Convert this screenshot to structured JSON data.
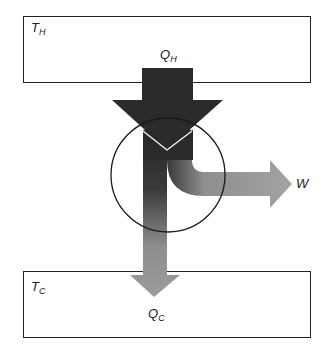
{
  "diagram": {
    "type": "heat-engine-energy-flow",
    "hot_reservoir": {
      "label": "T",
      "subscript": "H"
    },
    "cold_reservoir": {
      "label": "T",
      "subscript": "C"
    },
    "heat_in": {
      "label": "Q",
      "subscript": "H"
    },
    "heat_out": {
      "label": "Q",
      "subscript": "C"
    },
    "work_out": {
      "label": "W"
    },
    "colors": {
      "box_stroke": "#222222",
      "heat_in_arrow": "#2a2a2a",
      "heat_out_arrow": "#9a9a9a",
      "work_arrow": "#a0a0a0",
      "engine_circle": "#1a1a1a"
    }
  }
}
